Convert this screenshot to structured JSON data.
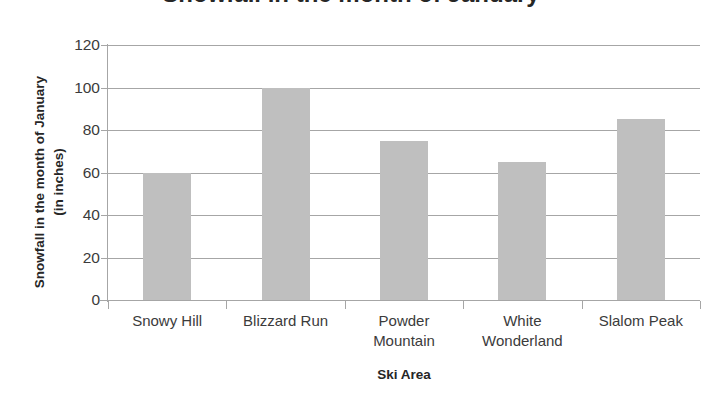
{
  "chart_data": {
    "type": "bar",
    "title": "Snowfall in the month of January",
    "xlabel": "Ski Area",
    "ylabel": "Snowfall in the month of January (in inches)",
    "ylabel_lines": [
      "Snowfall in the month of January",
      "(in inches)"
    ],
    "categories": [
      "Snowy Hill",
      "Blizzard Run",
      "Powder Mountain",
      "White Wonderland",
      "Slalom Peak"
    ],
    "category_lines": [
      [
        "Snowy Hill"
      ],
      [
        "Blizzard Run"
      ],
      [
        "Powder",
        "Mountain"
      ],
      [
        "White",
        "Wonderland"
      ],
      [
        "Slalom Peak"
      ]
    ],
    "values": [
      60,
      100,
      75,
      65,
      85
    ],
    "ylim": [
      0,
      120
    ],
    "yticks": [
      0,
      20,
      40,
      60,
      80,
      100,
      120
    ],
    "ytick_labels": [
      "0",
      "20",
      "40",
      "60",
      "80",
      "100",
      "120"
    ],
    "grid": true,
    "legend": false,
    "bar_color": "#bfbfbf",
    "grid_color": "#a6a6a6",
    "text_color": "#3b3b3b"
  }
}
